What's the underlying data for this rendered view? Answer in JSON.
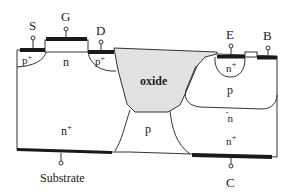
{
  "diagram": {
    "terminals": {
      "source": "S",
      "gate": "G",
      "drain": "D",
      "emitter": "E",
      "base": "B",
      "collector": "C",
      "substrate": "Substrate"
    },
    "regions": {
      "p_plus_left": "p",
      "p_plus_left_sup": "+",
      "n_channel": "n",
      "p_plus_right": "p",
      "p_plus_right_sup": "+",
      "oxide": "oxide",
      "n_plus_substrate": "n",
      "n_plus_substrate_sup": "+",
      "p_isolation": "p",
      "n_plus_emitter": "n",
      "n_plus_emitter_sup": "+",
      "p_base": "p",
      "n_minus_drift": "n",
      "n_minus_drift_sup": "-",
      "n_plus_collector": "n",
      "n_plus_collector_sup": "+"
    },
    "colors": {
      "line": "#333333",
      "metal": "#1a1a1a",
      "oxide_fill": "#e2e2e2",
      "gate_oxide_fill": "#ffffff",
      "background": "#ffffff"
    }
  }
}
